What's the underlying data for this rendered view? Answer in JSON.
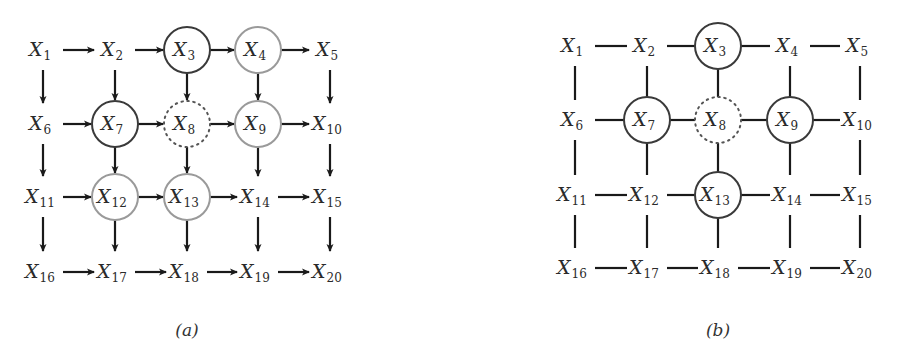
{
  "figures": [
    {
      "id": "a",
      "caption": "(a)",
      "type": "directed-grid",
      "columns_x": [
        43,
        115,
        187,
        258,
        330
      ],
      "rows_y": [
        50,
        124,
        197,
        272
      ],
      "caption_pos": [
        187,
        336
      ],
      "nodes": [
        {
          "var": "X",
          "sub": "1",
          "circle": "none"
        },
        {
          "var": "X",
          "sub": "2",
          "circle": "none"
        },
        {
          "var": "X",
          "sub": "3",
          "circle": "dark"
        },
        {
          "var": "X",
          "sub": "4",
          "circle": "gray"
        },
        {
          "var": "X",
          "sub": "5",
          "circle": "none"
        },
        {
          "var": "X",
          "sub": "6",
          "circle": "none"
        },
        {
          "var": "X",
          "sub": "7",
          "circle": "dark"
        },
        {
          "var": "X",
          "sub": "8",
          "circle": "dotted"
        },
        {
          "var": "X",
          "sub": "9",
          "circle": "gray"
        },
        {
          "var": "X",
          "sub": "10",
          "circle": "none"
        },
        {
          "var": "X",
          "sub": "11",
          "circle": "none"
        },
        {
          "var": "X",
          "sub": "12",
          "circle": "gray"
        },
        {
          "var": "X",
          "sub": "13",
          "circle": "gray"
        },
        {
          "var": "X",
          "sub": "14",
          "circle": "none"
        },
        {
          "var": "X",
          "sub": "15",
          "circle": "none"
        },
        {
          "var": "X",
          "sub": "16",
          "circle": "none"
        },
        {
          "var": "X",
          "sub": "17",
          "circle": "none"
        },
        {
          "var": "X",
          "sub": "18",
          "circle": "none"
        },
        {
          "var": "X",
          "sub": "19",
          "circle": "none"
        },
        {
          "var": "X",
          "sub": "20",
          "circle": "none"
        }
      ]
    },
    {
      "id": "b",
      "caption": "(b)",
      "type": "undirected-grid",
      "columns_x": [
        575,
        647,
        718,
        790,
        860
      ],
      "rows_y": [
        46,
        120,
        195,
        268
      ],
      "caption_pos": [
        718,
        336
      ],
      "nodes": [
        {
          "var": "X",
          "sub": "1",
          "circle": "none"
        },
        {
          "var": "X",
          "sub": "2",
          "circle": "none"
        },
        {
          "var": "X",
          "sub": "3",
          "circle": "dark"
        },
        {
          "var": "X",
          "sub": "4",
          "circle": "none"
        },
        {
          "var": "X",
          "sub": "5",
          "circle": "none"
        },
        {
          "var": "X",
          "sub": "6",
          "circle": "none"
        },
        {
          "var": "X",
          "sub": "7",
          "circle": "dark"
        },
        {
          "var": "X",
          "sub": "8",
          "circle": "dotted"
        },
        {
          "var": "X",
          "sub": "9",
          "circle": "dark"
        },
        {
          "var": "X",
          "sub": "10",
          "circle": "none"
        },
        {
          "var": "X",
          "sub": "11",
          "circle": "none"
        },
        {
          "var": "X",
          "sub": "12",
          "circle": "none"
        },
        {
          "var": "X",
          "sub": "13",
          "circle": "dark"
        },
        {
          "var": "X",
          "sub": "14",
          "circle": "none"
        },
        {
          "var": "X",
          "sub": "15",
          "circle": "none"
        },
        {
          "var": "X",
          "sub": "16",
          "circle": "none"
        },
        {
          "var": "X",
          "sub": "17",
          "circle": "none"
        },
        {
          "var": "X",
          "sub": "18",
          "circle": "none"
        },
        {
          "var": "X",
          "sub": "19",
          "circle": "none"
        },
        {
          "var": "X",
          "sub": "20",
          "circle": "none"
        }
      ]
    }
  ],
  "style": {
    "dark_circle": "#3a3a3a",
    "gray_circle": "#9a9a9a",
    "dotted_circle": "#555555",
    "edge_color": "#1a1a1a",
    "circle_radius": 23
  }
}
